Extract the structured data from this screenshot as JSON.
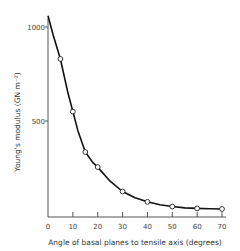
{
  "chart_data": {
    "type": "line",
    "title": "",
    "xlabel": "Angle of basal planes to tensile axis (degrees)",
    "ylabel": "Young's modulus (GN m⁻²)",
    "xlim": [
      0,
      70
    ],
    "ylim": [
      0,
      1050
    ],
    "x_ticks": [
      0,
      10,
      20,
      30,
      40,
      50,
      60,
      70
    ],
    "y_ticks": [
      500,
      1000
    ],
    "grid": false,
    "legend": null,
    "series": [
      {
        "name": "Young's modulus",
        "markers": "open-circle",
        "x": [
          5,
          10,
          15,
          20,
          30,
          40,
          50,
          60,
          70
        ],
        "values": [
          830,
          550,
          335,
          255,
          125,
          70,
          45,
          35,
          32
        ]
      }
    ],
    "curve": {
      "x": [
        0,
        2,
        5,
        8,
        10,
        12,
        15,
        18,
        20,
        25,
        30,
        35,
        40,
        45,
        50,
        55,
        60,
        65,
        70
      ],
      "values": [
        1060,
        960,
        830,
        650,
        550,
        450,
        335,
        280,
        255,
        180,
        125,
        92,
        70,
        55,
        45,
        38,
        35,
        33,
        32
      ]
    }
  }
}
